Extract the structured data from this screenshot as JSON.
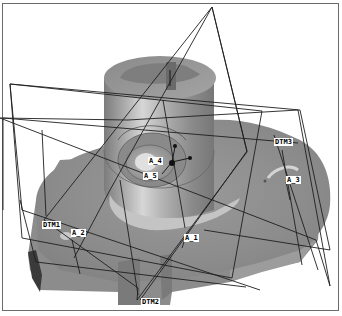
{
  "viewport": {
    "background": "#ffffff",
    "model_shade": "#8e8e8e"
  },
  "datums": {
    "planes": [
      {
        "id": "dtm1",
        "label": "DTM1"
      },
      {
        "id": "dtm2",
        "label": "DTM2"
      },
      {
        "id": "dtm3",
        "label": "DTM3"
      }
    ],
    "axes": [
      {
        "id": "a1",
        "label": "A_1"
      },
      {
        "id": "a2",
        "label": "A_2"
      },
      {
        "id": "a3",
        "label": "A_3"
      },
      {
        "id": "a4",
        "label": "A_4"
      },
      {
        "id": "a5",
        "label": "A_5"
      }
    ]
  }
}
